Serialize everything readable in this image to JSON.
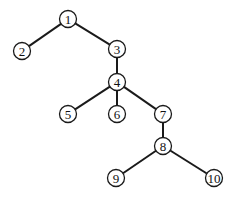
{
  "diagram": {
    "type": "tree",
    "colors": {
      "stroke": "#1a1a1a",
      "fill": "#ffffff",
      "text": "#111111"
    },
    "nodes": [
      {
        "id": "1",
        "label": "1",
        "x": 68,
        "y": 19
      },
      {
        "id": "2",
        "label": "2",
        "x": 22,
        "y": 51
      },
      {
        "id": "3",
        "label": "3",
        "x": 117,
        "y": 49
      },
      {
        "id": "4",
        "label": "4",
        "x": 117,
        "y": 82
      },
      {
        "id": "5",
        "label": "5",
        "x": 68,
        "y": 114
      },
      {
        "id": "6",
        "label": "6",
        "x": 117,
        "y": 114
      },
      {
        "id": "7",
        "label": "7",
        "x": 163,
        "y": 114
      },
      {
        "id": "8",
        "label": "8",
        "x": 163,
        "y": 146
      },
      {
        "id": "9",
        "label": "9",
        "x": 116,
        "y": 178
      },
      {
        "id": "10",
        "label": "10",
        "x": 214,
        "y": 178
      }
    ],
    "edges": [
      {
        "from": "1",
        "to": "2"
      },
      {
        "from": "1",
        "to": "3"
      },
      {
        "from": "3",
        "to": "4"
      },
      {
        "from": "4",
        "to": "5"
      },
      {
        "from": "4",
        "to": "6"
      },
      {
        "from": "4",
        "to": "7"
      },
      {
        "from": "7",
        "to": "8"
      },
      {
        "from": "8",
        "to": "9"
      },
      {
        "from": "8",
        "to": "10"
      }
    ]
  }
}
